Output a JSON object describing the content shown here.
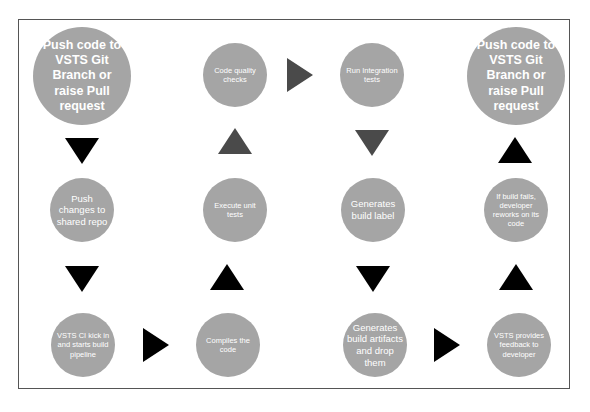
{
  "diagram": {
    "type": "flowchart",
    "title_fragment": "g                        p",
    "colors": {
      "node_fill": "#a5a5a5",
      "node_text": "#ffffff",
      "arrow_black": "#000000",
      "arrow_dark_gray": "#4a4a4a",
      "frame_border": "#555555"
    },
    "nodes": [
      {
        "id": "n1",
        "label": "Push code to VSTS Git Branch or raise Pull request",
        "lines": [
          "Push code to",
          "VSTS Git",
          "Branch or",
          "raise Pull",
          "request"
        ]
      },
      {
        "id": "n2",
        "label": "Push changes to shared repo",
        "lines": [
          "Push",
          "changes",
          "to shared",
          "repo"
        ]
      },
      {
        "id": "n3",
        "label": "VSTS CI kick in and starts build pipeline",
        "lines": [
          "VSTS CI kick",
          "in and",
          "starts build",
          "pipeline"
        ]
      },
      {
        "id": "n4",
        "label": "Compiles the code",
        "lines": [
          "Compiles",
          "the code"
        ]
      },
      {
        "id": "n5",
        "label": "Execute unit tests",
        "lines": [
          "Execute",
          "unit tests"
        ]
      },
      {
        "id": "n6",
        "label": "Code quality checks",
        "lines": [
          "Code",
          "quality",
          "checks"
        ]
      },
      {
        "id": "n7",
        "label": "Run Integration tests",
        "lines": [
          "Run",
          "Integration",
          "tests"
        ]
      },
      {
        "id": "n8",
        "label": "Generates build label",
        "lines": [
          "Generates",
          "build label"
        ]
      },
      {
        "id": "n9",
        "label": "Generates build artifacts and drop them",
        "lines": [
          "Generates",
          "build",
          "artifacts",
          "and drop",
          "them"
        ]
      },
      {
        "id": "n10",
        "label": "VSTS provides feedback to developer",
        "lines": [
          "VSTS",
          "provides",
          "feedback to",
          "developer"
        ]
      },
      {
        "id": "n11",
        "label": "If build fails, developer reworks on its code",
        "lines": [
          "If build fails,",
          "developer",
          "reworks on",
          "its code"
        ]
      },
      {
        "id": "n12",
        "label": "Push code to VSTS Git Branch or raise Pull request",
        "lines": [
          "Push code to",
          "VSTS Git",
          "Branch or",
          "raise Pull",
          "request"
        ]
      }
    ],
    "edges": [
      {
        "from": "n1",
        "to": "n2",
        "direction": "down",
        "color": "black"
      },
      {
        "from": "n2",
        "to": "n3",
        "direction": "down",
        "color": "black"
      },
      {
        "from": "n3",
        "to": "n4",
        "direction": "right",
        "color": "black"
      },
      {
        "from": "n4",
        "to": "n5",
        "direction": "up",
        "color": "black"
      },
      {
        "from": "n5",
        "to": "n6",
        "direction": "up",
        "color": "dark-gray"
      },
      {
        "from": "n6",
        "to": "n7",
        "direction": "right",
        "color": "dark-gray"
      },
      {
        "from": "n7",
        "to": "n8",
        "direction": "down",
        "color": "dark-gray"
      },
      {
        "from": "n8",
        "to": "n9",
        "direction": "down",
        "color": "black"
      },
      {
        "from": "n9",
        "to": "n10",
        "direction": "right",
        "color": "black"
      },
      {
        "from": "n10",
        "to": "n11",
        "direction": "up",
        "color": "black"
      },
      {
        "from": "n11",
        "to": "n12",
        "direction": "up",
        "color": "black"
      }
    ]
  }
}
